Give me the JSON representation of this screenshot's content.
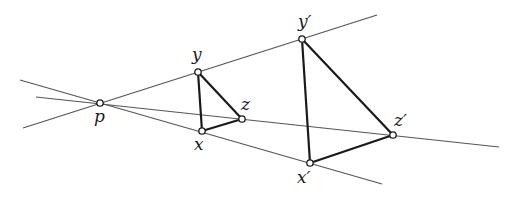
{
  "diagram": {
    "colors": {
      "ray": "#555555",
      "edge": "#1a1a1a",
      "background": "#ffffff"
    },
    "center": {
      "id": "p",
      "label": "p",
      "x": 100,
      "y": 103
    },
    "rays": [
      {
        "id": "ray-y",
        "through": [
          "p",
          "y",
          "y'"
        ],
        "x1": 23,
        "y1": 128,
        "x2": 377,
        "y2": 15
      },
      {
        "id": "ray-z",
        "through": [
          "p",
          "z",
          "z'"
        ],
        "x1": 36,
        "y1": 97,
        "x2": 499,
        "y2": 147
      },
      {
        "id": "ray-x",
        "through": [
          "p",
          "x",
          "x'"
        ],
        "x1": 20,
        "y1": 80,
        "x2": 382,
        "y2": 184
      }
    ],
    "points": [
      {
        "id": "y",
        "label": "y",
        "x": 198,
        "y": 72,
        "lx": 192,
        "ly": 60
      },
      {
        "id": "x",
        "label": "x",
        "x": 202,
        "y": 131,
        "lx": 194,
        "ly": 150
      },
      {
        "id": "z",
        "label": "z",
        "x": 242,
        "y": 119,
        "lx": 241,
        "ly": 110
      },
      {
        "id": "y'",
        "label": "y′",
        "x": 302,
        "y": 39,
        "lx": 298,
        "ly": 27
      },
      {
        "id": "x'",
        "label": "x′",
        "x": 310,
        "y": 163,
        "lx": 297,
        "ly": 183
      },
      {
        "id": "z'",
        "label": "z′",
        "x": 393,
        "y": 135,
        "lx": 394,
        "ly": 126
      }
    ],
    "triangles": [
      {
        "id": "small-triangle",
        "vertices": [
          "x",
          "y",
          "z"
        ]
      },
      {
        "id": "large-triangle",
        "vertices": [
          "x'",
          "y'",
          "z'"
        ]
      }
    ],
    "labels": {
      "p": "p",
      "x": "x",
      "y": "y",
      "z": "z",
      "x_prime": "x′",
      "y_prime": "y′",
      "z_prime": "z′"
    }
  }
}
